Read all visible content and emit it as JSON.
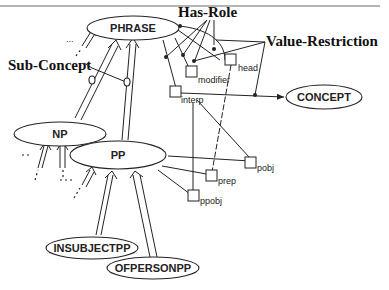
{
  "diagram": {
    "type": "KL-ONE semantic network",
    "annotations": {
      "has_role": "Has-Role",
      "value_restriction": "Value-Restriction",
      "sub_concept": "Sub-Concept",
      "ellipsis": "..."
    },
    "concepts": [
      {
        "id": "phrase",
        "label": "PHRASE"
      },
      {
        "id": "np",
        "label": "NP"
      },
      {
        "id": "pp",
        "label": "PP"
      },
      {
        "id": "concept",
        "label": "CONCEPT"
      },
      {
        "id": "insubjectpp",
        "label": "INSUBJECTPP"
      },
      {
        "id": "ofpersonpp",
        "label": "OFPERSONPP"
      }
    ],
    "roles": [
      {
        "id": "head",
        "label": "head",
        "owner": "PHRASE"
      },
      {
        "id": "modifier",
        "label": "modifier",
        "owner": "PHRASE"
      },
      {
        "id": "interp",
        "label": "interp",
        "owner": "PHRASE"
      },
      {
        "id": "pobj",
        "label": "pobj",
        "owner": "PP"
      },
      {
        "id": "prep",
        "label": "prep",
        "owner": "PP"
      },
      {
        "id": "ppobj",
        "label": "ppobj",
        "owner": "PP"
      }
    ],
    "edges": [
      {
        "from": "NP",
        "to": "PHRASE",
        "type": "sub-concept"
      },
      {
        "from": "PP",
        "to": "PHRASE",
        "type": "sub-concept"
      },
      {
        "from": "INSUBJECTPP",
        "to": "PP",
        "type": "sub-concept"
      },
      {
        "from": "OFPERSONPP",
        "to": "PP",
        "type": "sub-concept"
      },
      {
        "from": "interp",
        "to": "CONCEPT",
        "type": "value-restriction"
      }
    ]
  }
}
